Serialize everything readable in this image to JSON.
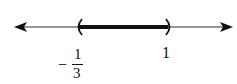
{
  "number_line": {
    "interval": "(-1/3, 1)",
    "left_endpoint": {
      "value": -0.3333,
      "label_sign": "−",
      "label_numerator": "1",
      "label_denominator": "3",
      "type": "open-parenthesis"
    },
    "right_endpoint": {
      "value": 1,
      "label": "1",
      "type": "open-parenthesis"
    },
    "arrows": [
      "left",
      "right"
    ],
    "colors": {
      "line": "#333333",
      "segment": "#111111"
    }
  }
}
